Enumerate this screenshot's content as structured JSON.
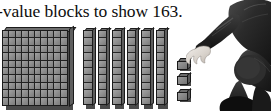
{
  "page": {
    "background_color": "#ffffff",
    "width": 271,
    "height": 111
  },
  "caption": {
    "text": "-value blocks to show 163.",
    "full_phrase_hint": "-value blocks to show 163.",
    "target_number": "163",
    "truncated_left": true,
    "color": "#0d0d0d"
  },
  "blocks": {
    "hundreds": {
      "label": "hundreds-flat",
      "count": 1,
      "value_each": 100,
      "grid_rows": 10,
      "grid_cols": 10,
      "total_cells": 100,
      "face_color": "#8f8f8f",
      "line_color": "#212121"
    },
    "tens": {
      "label": "tens-rods",
      "count": 6,
      "value_each": 10,
      "segments_per_rod": 10,
      "face_color": "#8d8d8d",
      "line_color": "#262626"
    },
    "ones": {
      "label": "unit-cubes",
      "count": 3,
      "value_each": 1,
      "face_color": "#848484",
      "line_color": "#191919"
    },
    "total_value": "163",
    "breakdown": "100 + 60 + 3 = 163"
  },
  "person": {
    "description": "person crouching, reaching hand toward the place-value blocks",
    "clothing_color": "#2a2a2a",
    "skin_color": "#e8e4df"
  },
  "icons": {
    "hundreds_flat": "hundreds-flat-icon",
    "ten_rod": "ten-rod-icon",
    "unit_cube": "unit-cube-icon",
    "person": "person-reaching-icon"
  }
}
